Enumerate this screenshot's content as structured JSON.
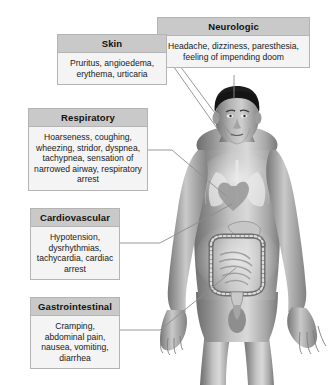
{
  "diagram": {
    "background_color": "#ffffff",
    "header_color": "#c9c9c9",
    "body_color": "#f4f4f4",
    "border_color": "#b4b4b4",
    "connector_color": "#8c8c8c"
  },
  "figure": {
    "label": "anatomical male figure with internal organs",
    "style": "grayscale medical illustration",
    "regions": [
      "head",
      "neck",
      "chest",
      "heart",
      "lungs",
      "abdomen",
      "large intestine",
      "small intestine",
      "arms",
      "hands",
      "pelvis",
      "legs"
    ]
  },
  "callouts": [
    {
      "id": "skin",
      "title": "Skin",
      "body": "Pruritus, angioedema, erythema, urticaria",
      "target": "neck and shoulder"
    },
    {
      "id": "neurologic",
      "title": "Neurologic",
      "body": "Headache, dizziness, paresthesia, feeling of impending doom",
      "target": "head"
    },
    {
      "id": "respiratory",
      "title": "Respiratory",
      "body": "Hoarseness, coughing, wheezing, stridor, dyspnea, tachypnea, sensation of narrowed airway, respiratory arrest",
      "target": "chest and lungs"
    },
    {
      "id": "cardiovascular",
      "title": "Cardiovascular",
      "body": "Hypotension, dysrhythmias, tachycardia, cardiac arrest",
      "target": "heart"
    },
    {
      "id": "gastrointestinal",
      "title": "Gastrointestinal",
      "body": "Cramping, abdominal pain, nausea, vomiting, diarrhea",
      "target": "abdomen and intestines"
    }
  ]
}
